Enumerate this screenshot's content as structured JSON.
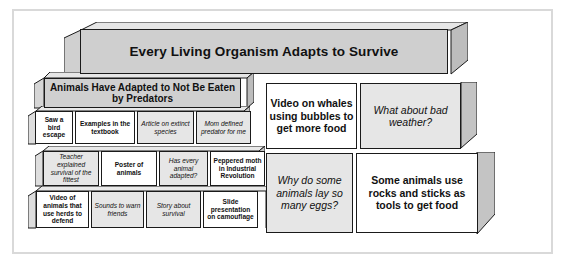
{
  "title": {
    "text": "Every Living Organism Adapts to Survive"
  },
  "subtitle": {
    "text": "Animals Have Adapted to Not Be Eaten by Predators"
  },
  "colors": {
    "title_fill": "#cfcfcf",
    "subtitle_fill": "#d0d0d0",
    "note_white": "#ffffff",
    "note_gray": "#e6e6e6",
    "side_shade": "#bdbdbd",
    "lid_shade": "#e3e3e3",
    "outline": "#1a1a1a",
    "frame": "#d9d9d9",
    "page_bg": "#ffffff"
  },
  "left_grid": {
    "rows": [
      {
        "cells": [
          {
            "text": "Saw a bird escape",
            "style": "bold"
          },
          {
            "text": "Examples in the textbook",
            "style": "bold"
          },
          {
            "text": "Article on extinct species",
            "style": "ital"
          },
          {
            "text": "Mom defined predator for me",
            "style": "ital"
          }
        ]
      },
      {
        "cells": [
          {
            "text": "Teacher explained survival of the fittest",
            "style": "ital"
          },
          {
            "text": "Poster of animals",
            "style": "bold"
          },
          {
            "text": "Has every animal adapted?",
            "style": "ital"
          },
          {
            "text": "Peppered moth in Industrial Revolution",
            "style": "bold"
          }
        ]
      },
      {
        "cells": [
          {
            "text": "Video of animals that use herds to defend",
            "style": "bold"
          },
          {
            "text": "Sounds to warn friends",
            "style": "ital"
          },
          {
            "text": "Story about survival",
            "style": "ital"
          },
          {
            "text": "Slide presentation on camouflage",
            "style": "bold"
          }
        ]
      }
    ]
  },
  "right_boxes": [
    {
      "text": "Video on whales using bubbles to get more food",
      "style": "bold"
    },
    {
      "text": "What about bad weather?",
      "style": "ital"
    },
    {
      "text": "Why do some animals lay so many eggs?",
      "style": "ital"
    },
    {
      "text": "Some animals use rocks and sticks as tools to get food",
      "style": "bold"
    }
  ]
}
